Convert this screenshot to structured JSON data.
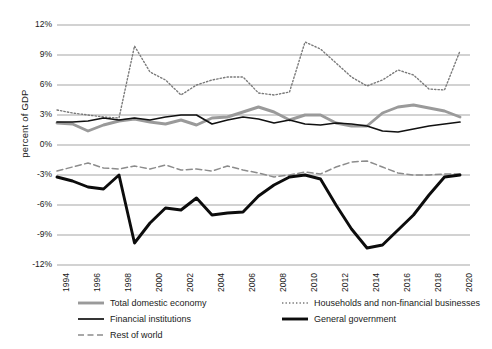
{
  "chart_data": {
    "type": "line",
    "title": "",
    "xlabel": "",
    "ylabel": "percent of GDP",
    "ylim": [
      -12,
      12
    ],
    "ytick_values": [
      12,
      9,
      6,
      3,
      0,
      -3,
      -6,
      -9,
      -12
    ],
    "ytick_labels": [
      "12%",
      "9%",
      "6%",
      "3%",
      "0%",
      "-3%",
      "-6%",
      "-9%",
      "-12%"
    ],
    "grid": true,
    "legend_position": "bottom",
    "x": [
      1994,
      1995,
      1996,
      1997,
      1998,
      1999,
      2000,
      2001,
      2002,
      2003,
      2004,
      2005,
      2006,
      2007,
      2008,
      2009,
      2010,
      2011,
      2012,
      2013,
      2014,
      2015,
      2016,
      2017,
      2018,
      2019,
      2020
    ],
    "xtick_labels": [
      "1994",
      "1996",
      "1998",
      "2000",
      "2002",
      "2004",
      "2006",
      "2008",
      "2010",
      "2012",
      "2014",
      "2016",
      "2018",
      "2020"
    ],
    "xtick_values": [
      1994,
      1996,
      1998,
      2000,
      2002,
      2004,
      2006,
      2008,
      2010,
      2012,
      2014,
      2016,
      2018,
      2020
    ],
    "series": [
      {
        "name": "Total domestic economy",
        "style": "solid-thick-gray",
        "color": "#9a9a9a",
        "values": [
          2.2,
          2.1,
          1.4,
          2.0,
          2.4,
          2.6,
          2.3,
          2.1,
          2.5,
          2.0,
          2.7,
          2.8,
          3.3,
          3.8,
          3.3,
          2.5,
          3.0,
          3.0,
          2.2,
          1.9,
          1.9,
          3.2,
          3.8,
          4.0,
          3.7,
          3.4,
          2.8
        ]
      },
      {
        "name": "Financial institutions",
        "style": "solid-thin-black",
        "color": "#111111",
        "values": [
          2.3,
          2.3,
          2.4,
          2.7,
          2.5,
          2.7,
          2.5,
          2.8,
          3.0,
          3.0,
          2.1,
          2.5,
          2.8,
          2.6,
          2.2,
          2.5,
          2.1,
          2.0,
          2.2,
          2.1,
          1.9,
          1.4,
          1.3,
          1.6,
          1.9,
          2.1,
          2.3
        ]
      },
      {
        "name": "Households and non-financial businesses",
        "style": "dotted-gray",
        "color": "#7a7a7a",
        "values": [
          3.5,
          3.2,
          3.0,
          2.8,
          2.7,
          9.9,
          7.3,
          6.5,
          5.0,
          6.0,
          6.5,
          6.8,
          6.8,
          5.2,
          5.0,
          5.3,
          10.3,
          9.6,
          8.2,
          6.8,
          5.9,
          6.5,
          7.5,
          7.0,
          5.6,
          5.5,
          9.4
        ]
      },
      {
        "name": "General government",
        "style": "solid-extra-thick-black",
        "color": "#0c0c0c",
        "values": [
          -3.2,
          -3.6,
          -4.2,
          -4.4,
          -3.0,
          -9.8,
          -7.8,
          -6.3,
          -6.5,
          -5.3,
          -7.0,
          -6.8,
          -6.7,
          -5.1,
          -4.0,
          -3.2,
          -3.0,
          -3.4,
          -6.0,
          -8.4,
          -10.3,
          -10.0,
          -8.5,
          -7.0,
          -5.0,
          -3.2,
          -3.0
        ]
      },
      {
        "name": "Rest of world",
        "style": "dashed-gray",
        "color": "#8c8c8c",
        "values": [
          -2.6,
          -2.2,
          -1.8,
          -2.3,
          -2.4,
          -2.1,
          -2.4,
          -2.0,
          -2.5,
          -2.4,
          -2.6,
          -2.1,
          -2.5,
          -2.8,
          -3.2,
          -3.0,
          -2.7,
          -2.9,
          -2.2,
          -1.7,
          -1.6,
          -2.2,
          -2.8,
          -3.0,
          -3.0,
          -2.9,
          -2.9
        ]
      }
    ],
    "legend_entries": [
      {
        "label": "Total domestic economy",
        "style": "solid-thick-gray",
        "color": "#9a9a9a"
      },
      {
        "label": "Households and non-financial businesses",
        "style": "dotted-gray",
        "color": "#7a7a7a"
      },
      {
        "label": "Financial institutions",
        "style": "solid-thin-black",
        "color": "#111111"
      },
      {
        "label": "General government",
        "style": "solid-extra-thick-black",
        "color": "#0c0c0c"
      },
      {
        "label": "Rest of world",
        "style": "dashed-gray",
        "color": "#8c8c8c"
      }
    ],
    "colors": {
      "grid": "#a6a6a6",
      "background": "#ffffff",
      "text": "#1a1a1a"
    }
  }
}
